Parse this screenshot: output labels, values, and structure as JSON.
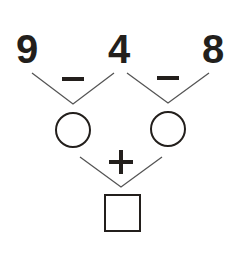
{
  "numbers": [
    "9",
    "4",
    "8"
  ],
  "operators": {
    "top_left": "−",
    "top_right": "−",
    "bottom": "+"
  },
  "colors": {
    "ink": "#231f1c",
    "line": "#555555",
    "background": "#ffffff"
  }
}
